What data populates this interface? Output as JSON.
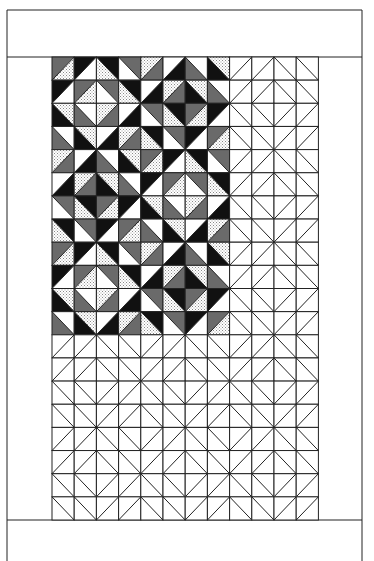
{
  "diagram": {
    "title": "",
    "type": "quilt-block-layout",
    "canvas": {
      "width": 374,
      "height": 561
    },
    "frame": {
      "left": 7,
      "right": 362,
      "top": 10,
      "top_band_bottom": 57,
      "bottom_band_top": 520,
      "bottom": 561
    },
    "grid": {
      "x": 52,
      "y": 57,
      "cols": 12,
      "rows": 20,
      "cell_w": 22.2,
      "cell_h": 23.15
    },
    "colors": {
      "G": "#6a6a6a",
      "B": "#111111",
      "W": "#ffffff",
      "D": "dots",
      "line": "#222222"
    },
    "legend": {
      "G": "gray",
      "B": "black",
      "W": "white",
      "D": "dotted"
    },
    "blocks": {
      "A": [
        [
          [
            "/",
            "G",
            "D"
          ],
          [
            "/",
            "B",
            "W"
          ],
          [
            "\\",
            "B",
            "D"
          ],
          [
            "\\",
            "G",
            "W"
          ]
        ],
        [
          [
            "/",
            "B",
            "W"
          ],
          [
            "/",
            "G",
            "D"
          ],
          [
            "\\",
            "G",
            "W"
          ],
          [
            "\\",
            "B",
            "D"
          ]
        ],
        [
          [
            "\\",
            "D",
            "B"
          ],
          [
            "\\",
            "W",
            "G"
          ],
          [
            "/",
            "D",
            "G"
          ],
          [
            "/",
            "W",
            "B"
          ]
        ],
        [
          [
            "\\",
            "W",
            "G"
          ],
          [
            "\\",
            "D",
            "B"
          ],
          [
            "/",
            "W",
            "B"
          ],
          [
            "/",
            "D",
            "G"
          ]
        ]
      ],
      "B": [
        [
          [
            "/",
            "D",
            "G"
          ],
          [
            "/",
            "W",
            "B"
          ],
          [
            "\\",
            "W",
            "G"
          ],
          [
            "\\",
            "D",
            "B"
          ]
        ],
        [
          [
            "/",
            "W",
            "B"
          ],
          [
            "/",
            "D",
            "G"
          ],
          [
            "\\",
            "D",
            "B"
          ],
          [
            "\\",
            "W",
            "G"
          ]
        ],
        [
          [
            "\\",
            "G",
            "W"
          ],
          [
            "\\",
            "B",
            "D"
          ],
          [
            "/",
            "G",
            "D"
          ],
          [
            "/",
            "B",
            "W"
          ]
        ],
        [
          [
            "\\",
            "B",
            "D"
          ],
          [
            "\\",
            "G",
            "W"
          ],
          [
            "/",
            "B",
            "W"
          ],
          [
            "/",
            "G",
            "D"
          ]
        ]
      ]
    },
    "colored_layout": [
      [
        "A",
        "B"
      ],
      [
        "B",
        "A"
      ],
      [
        "A",
        "B"
      ]
    ],
    "colored_region": {
      "cols": 8,
      "rows": 12
    }
  }
}
